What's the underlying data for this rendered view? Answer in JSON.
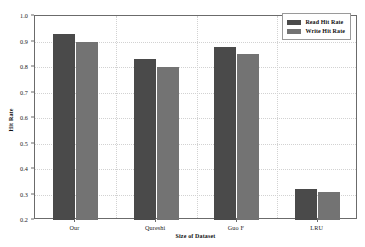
{
  "chart_data": {
    "type": "bar",
    "title": "",
    "xlabel": "Size of Dataset",
    "ylabel": "Hit Rate",
    "categories": [
      "Our",
      "Qureshi",
      "Guo F",
      "LRU"
    ],
    "series": [
      {
        "name": "Read Hit Rate",
        "color": "#4a4a4a",
        "values": [
          0.93,
          0.83,
          0.88,
          0.32
        ]
      },
      {
        "name": "Write Hit Rate",
        "color": "#737373",
        "values": [
          0.9,
          0.8,
          0.85,
          0.31
        ]
      }
    ],
    "ylim": [
      0.2,
      1.0
    ],
    "yticks": [
      "1.0",
      "0.9",
      "0.8",
      "0.7",
      "0.6",
      "0.5",
      "0.4",
      "0.3",
      "0.2"
    ],
    "ytick_values": [
      1.0,
      0.9,
      0.8,
      0.7,
      0.6,
      0.5,
      0.4,
      0.3,
      0.2
    ],
    "grid": true,
    "legend_position": "upper right"
  }
}
